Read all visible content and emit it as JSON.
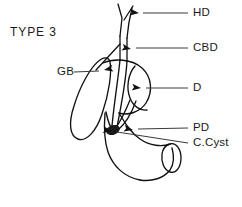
{
  "figure": {
    "title": "TYPE  3",
    "background_color": "#ffffff",
    "stroke_color": "#111111",
    "leader_color": "#3a3a3a",
    "cyst_fill_color": "#1a1a1a",
    "width": 242,
    "height": 207
  },
  "labels": [
    {
      "id": "hd",
      "text": "HD",
      "meaning": "hepatic-duct",
      "text_x": 193,
      "text_y": 13,
      "leader_x1": 188,
      "leader_y1": 13,
      "leader_x2": 143,
      "leader_y2": 13,
      "arrow_x": 139,
      "arrow_y": 13,
      "arrow_angle": 186
    },
    {
      "id": "cbd",
      "text": "CBD",
      "meaning": "common-bile-duct",
      "text_x": 193,
      "text_y": 48,
      "leader_x1": 188,
      "leader_y1": 48,
      "leader_x2": 136,
      "leader_y2": 48,
      "arrow_x": 131,
      "arrow_y": 49,
      "arrow_angle": 192
    },
    {
      "id": "gb",
      "text": "GB",
      "meaning": "gallbladder",
      "text_x": 57,
      "text_y": 72,
      "leader_x1": 74,
      "leader_y1": 72,
      "leader_x2": 99,
      "leader_y2": 71,
      "arrow_x": 104,
      "arrow_y": 70,
      "arrow_angle": 348
    },
    {
      "id": "d",
      "text": "D",
      "meaning": "duodenum",
      "text_x": 193,
      "text_y": 88,
      "leader_x1": 188,
      "leader_y1": 88,
      "leader_x2": 146,
      "leader_y2": 88,
      "arrow_x": 141,
      "arrow_y": 88,
      "arrow_angle": 186
    },
    {
      "id": "pd",
      "text": "PD",
      "meaning": "pancreatic-duct",
      "text_x": 193,
      "text_y": 128,
      "leader_x1": 188,
      "leader_y1": 128,
      "leader_x2": 138,
      "leader_y2": 129,
      "arrow_x": 133,
      "arrow_y": 130,
      "arrow_angle": 192
    },
    {
      "id": "ccyst",
      "text": "C.Cyst",
      "meaning": "choledochal-cyst",
      "text_x": 193,
      "text_y": 143,
      "leader_x1": 188,
      "leader_y1": 143,
      "leader_x2": 117,
      "leader_y2": 132,
      "arrow_x": 112,
      "arrow_y": 131,
      "arrow_angle": 189
    }
  ],
  "structures": [
    {
      "id": "hepatic-duct-left-branch",
      "name": "hepatic-duct-left-branch",
      "d": "M120 36 L122 18 L118 4"
    },
    {
      "id": "hepatic-duct-right-branch",
      "name": "hepatic-duct-right-branch",
      "d": "M124 20 L133 6"
    },
    {
      "id": "hepatic-duct-lateral-wall",
      "name": "hepatic-duct-lateral-wall",
      "d": "M127 38 C128 26 130 16 132 8"
    },
    {
      "id": "common-bile-duct-left-wall",
      "name": "common-bile-duct-left-wall",
      "d": "M120 36 L120 60"
    },
    {
      "id": "common-bile-duct-right-wall",
      "name": "common-bile-duct-right-wall",
      "d": "M127 38 L127 61"
    },
    {
      "id": "cystic-duct",
      "name": "cystic-duct",
      "d": "M120 44 L96 70"
    },
    {
      "id": "gallbladder-body",
      "name": "gallbladder-body",
      "d": "M100 60 C91 66 80 86 74 106 C68 124 70 136 78 139 C86 142 96 132 102 114 C109 94 112 72 110 62 C109 57 104 57 100 60 Z"
    },
    {
      "id": "duodenum-bulb-upper",
      "name": "duodenum-bulb-upper-wall",
      "d": "M103 63 C114 58 132 59 142 68 C152 77 153 92 146 103 C140 112 128 116 119 113"
    },
    {
      "id": "duodenum-bulb-inner-arc",
      "name": "duodenum-bulb-inner-arc",
      "d": "M135 66 C128 74 126 88 130 98 C133 106 140 111 147 110"
    },
    {
      "id": "duodenum-descending-left-wall",
      "name": "duodenum-descending-left-wall",
      "d": "M105 113 C104 126 104 140 108 152 C113 166 124 177 140 180"
    },
    {
      "id": "duodenum-descending-right-wall",
      "name": "duodenum-descending-right-wall",
      "d": "M119 113 C125 123 131 133 140 139 C150 146 162 147 170 144"
    },
    {
      "id": "duodenum-horizontal-lower-wall",
      "name": "duodenum-horizontal-lower-wall",
      "d": "M140 180 C152 182 164 178 170 170 C174 164 174 155 172 148"
    },
    {
      "id": "duodenum-distal-opening",
      "name": "duodenum-distal-opening-ellipse",
      "d": "M170 144 C176 142 181 149 181 158 C181 167 176 174 170 172 C164 170 161 162 162 154 C163 148 166 145 170 144 Z"
    },
    {
      "id": "ampulla-neck-left",
      "name": "ampulla-neck-left-wall",
      "d": "M106 112 C108 122 110 127 113 130"
    },
    {
      "id": "pancreatic-duct-segment",
      "name": "pancreatic-duct-segment",
      "d": "M130 100 C126 110 120 122 115 129"
    },
    {
      "id": "pancreatic-duct-segment-2",
      "name": "pancreatic-duct-segment-secondary",
      "d": "M136 101 C132 112 125 124 118 130"
    },
    {
      "id": "cbd-distal-into-cyst",
      "name": "common-bile-duct-distal-segment",
      "d": "M120 60 C118 80 114 104 112 126"
    },
    {
      "id": "cbd-distal-into-cyst-2",
      "name": "common-bile-duct-distal-segment-lateral",
      "d": "M127 61 C126 78 122 102 117 127"
    }
  ],
  "cyst": {
    "name": "choledochal-cyst-marker",
    "cx": 113,
    "cy": 130,
    "rx": 6.5,
    "ry": 4.2,
    "rotation": -20
  }
}
